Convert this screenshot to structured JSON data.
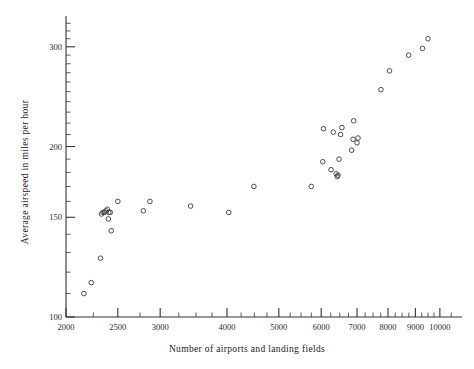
{
  "chart_data": {
    "type": "scatter",
    "title": "",
    "xlabel": "Number of airports and landing fields",
    "ylabel": "Average airspeed in miles per hour",
    "xscale": "log",
    "yscale": "log",
    "xlim": [
      2000,
      11000
    ],
    "ylim": [
      100,
      340
    ],
    "grid": false,
    "legend": null,
    "xticks": [
      2000,
      2500,
      3000,
      4000,
      5000,
      6000,
      7000,
      8000,
      9000,
      10000
    ],
    "xtick_labels": [
      "2000",
      "2500",
      "3000",
      "4000",
      "5000",
      "6000",
      "7000",
      "8000",
      "9000",
      "10000"
    ],
    "xminor_ticks": [
      2250,
      2750,
      3250,
      3500,
      3750,
      4250,
      4500,
      4750,
      5250,
      5500,
      5750,
      6250,
      6500,
      6750,
      7250,
      7500,
      7750,
      8250,
      8500,
      8750,
      9250,
      9500,
      9750,
      10500
    ],
    "yticks": [
      100,
      150,
      200,
      300
    ],
    "ytick_labels": [
      "100",
      "150",
      "200",
      "300"
    ],
    "yminor_ticks": [
      110,
      120,
      130,
      140,
      160,
      170,
      180,
      190,
      210,
      220,
      230,
      240,
      250,
      260,
      270,
      280,
      290,
      310,
      320,
      330
    ],
    "marker_style": "open-circle",
    "marker_size": 4.6,
    "marker_color": "#3a3a3a",
    "points": [
      {
        "x": 2160,
        "y": 110
      },
      {
        "x": 2230,
        "y": 115
      },
      {
        "x": 2320,
        "y": 127
      },
      {
        "x": 2330,
        "y": 152
      },
      {
        "x": 2345,
        "y": 153
      },
      {
        "x": 2360,
        "y": 153
      },
      {
        "x": 2375,
        "y": 154
      },
      {
        "x": 2390,
        "y": 155
      },
      {
        "x": 2400,
        "y": 149
      },
      {
        "x": 2405,
        "y": 153
      },
      {
        "x": 2420,
        "y": 153
      },
      {
        "x": 2430,
        "y": 142
      },
      {
        "x": 2500,
        "y": 160
      },
      {
        "x": 2790,
        "y": 154
      },
      {
        "x": 2870,
        "y": 160
      },
      {
        "x": 3420,
        "y": 157
      },
      {
        "x": 4030,
        "y": 153
      },
      {
        "x": 4490,
        "y": 170
      },
      {
        "x": 5750,
        "y": 170
      },
      {
        "x": 6040,
        "y": 188
      },
      {
        "x": 6060,
        "y": 215
      },
      {
        "x": 6260,
        "y": 182
      },
      {
        "x": 6320,
        "y": 212
      },
      {
        "x": 6400,
        "y": 179
      },
      {
        "x": 6430,
        "y": 177
      },
      {
        "x": 6450,
        "y": 178
      },
      {
        "x": 6480,
        "y": 190
      },
      {
        "x": 6520,
        "y": 210
      },
      {
        "x": 6560,
        "y": 216
      },
      {
        "x": 6840,
        "y": 197
      },
      {
        "x": 6880,
        "y": 206
      },
      {
        "x": 6900,
        "y": 222
      },
      {
        "x": 7000,
        "y": 203
      },
      {
        "x": 7030,
        "y": 207
      },
      {
        "x": 7760,
        "y": 252
      },
      {
        "x": 8050,
        "y": 272
      },
      {
        "x": 8740,
        "y": 290
      },
      {
        "x": 9280,
        "y": 298
      },
      {
        "x": 9500,
        "y": 310
      }
    ]
  }
}
